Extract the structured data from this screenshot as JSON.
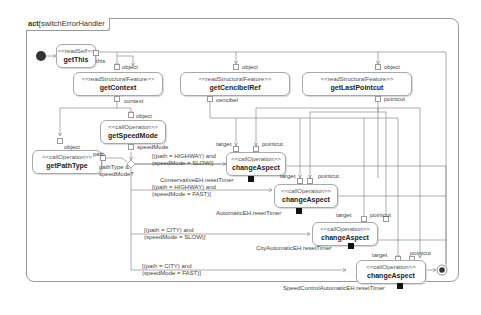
{
  "diagram": {
    "kind": "act",
    "name": "switchErrorHandler"
  },
  "actions": {
    "getThis": {
      "stereotype": "<<readSelf>>",
      "name": "getThis"
    },
    "getContext": {
      "stereotype": "<<readStructuralFeature>>",
      "name": "getContext"
    },
    "getCencibelRef": {
      "stereotype": "<<readStructuralFeature>>",
      "name": "getCencibelRef"
    },
    "getLastPointcut": {
      "stereotype": "<<readStructuralFeature>>",
      "name": "getLastPointcut"
    },
    "getSpeedMode": {
      "stereotype": "<<callOperation>>",
      "name": "getSpeedMode"
    },
    "getPathType": {
      "stereotype": "<<callOperation>>",
      "name": "getPathType"
    },
    "changeAspect1": {
      "stereotype": "<<callOperation>>",
      "name": "changeAspect"
    },
    "changeAspect2": {
      "stereotype": "<<callOperation>>",
      "name": "changeAspect"
    },
    "changeAspect3": {
      "stereotype": "<<callOperation>>",
      "name": "changeAspect"
    },
    "changeAspect4": {
      "stereotype": "<<callOperation>>",
      "name": "changeAspect"
    }
  },
  "pins": {
    "this": "this",
    "object": "object",
    "context": "context",
    "cencibel": "cencibel",
    "pointcut": "pointcut",
    "speedMode": "speedMode",
    "path": "path",
    "target": "target"
  },
  "decision_label": "pathType &\nspeedMode?",
  "guards": [
    "[(path = HIGHWAY) and\n(speedMode = SLOW)]",
    "[(path = HIGHWAY) and\n(speedMode = FAST)]",
    "[(path = CITY) and\n(speedMode = SLOW)]",
    "[(path = CITY) and\n(speedMode = FAST)]"
  ],
  "timers": [
    "ConservativeEH.resetTimer",
    "AutomaticEH.resetTimer",
    "CityAutomaticEH.resetTimer",
    "SpeedControlAutomaticEH.resetTimer"
  ],
  "colors": {
    "line": "#7a7a7a",
    "border": "#a8a8a8",
    "node_fill": "#333333"
  }
}
